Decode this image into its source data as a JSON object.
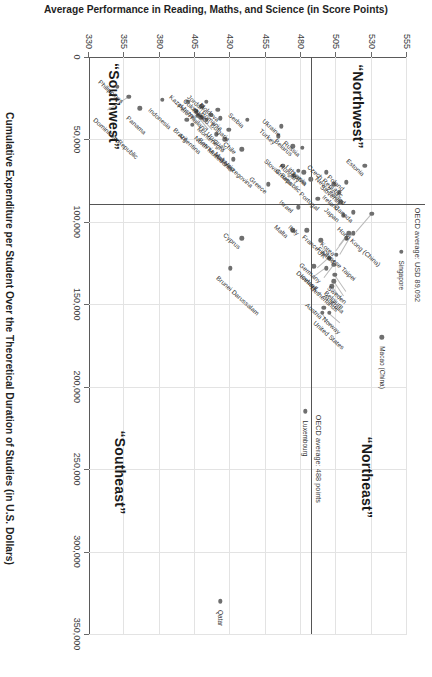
{
  "chart_data": {
    "type": "scatter",
    "title": "",
    "xlabel": "Cumulative Expenditure per Student Over the Theoretical Duration of Studies (in U.S. Dollars)",
    "ylabel": "Average Performance in Reading, Maths, and Science (in Score Points)",
    "xlim": [
      0,
      350000
    ],
    "ylim": [
      330,
      555
    ],
    "xticks": [
      0,
      50000,
      100000,
      150000,
      200000,
      250000,
      300000,
      350000
    ],
    "xticklabels": [
      "0",
      "50,000",
      "100,000",
      "150,000",
      "200,000",
      "250,000",
      "300,000",
      "350,000"
    ],
    "yticks": [
      330,
      355,
      380,
      405,
      430,
      455,
      480,
      505,
      530,
      555
    ],
    "yticklabels": [
      "330",
      "355",
      "380",
      "405",
      "430",
      "455",
      "480",
      "505",
      "530",
      "555"
    ],
    "grid": true,
    "legend": false,
    "reference_lines": [
      {
        "axis": "y",
        "value": 488,
        "label": "OECD average: 488 points"
      },
      {
        "axis": "x",
        "value": 89092,
        "label": "OECD average: USD 89,092"
      }
    ],
    "quadrant_labels": [
      {
        "name": "“Northwest”",
        "x": 30000,
        "y": 520
      },
      {
        "name": "“Northeast”",
        "x": 255000,
        "y": 527
      },
      {
        "name": "“Southwest”",
        "x": 30000,
        "y": 348
      },
      {
        "name": "“Southeast”",
        "x": 252000,
        "y": 352
      }
    ],
    "points": [
      {
        "name": "Singapore",
        "x": 118000,
        "y": 551,
        "lx": 9,
        "ly": -4,
        "rot": 0
      },
      {
        "name": "Macao (China)",
        "x": 170000,
        "y": 537,
        "lx": 9,
        "ly": -4,
        "rot": 0
      },
      {
        "name": "Hong Kong (China)",
        "x": 95000,
        "y": 530,
        "lx": -4,
        "ly": 14,
        "rot": -48,
        "lead": [
          95000,
          530,
          106000,
          519
        ]
      },
      {
        "name": "Estonia",
        "x": 66000,
        "y": 525,
        "lx": -6,
        "ly": 14,
        "rot": -48
      },
      {
        "name": "Chinese Taipei",
        "x": 107000,
        "y": 517,
        "lx": -4,
        "ly": 14,
        "rot": -48,
        "lead": [
          107000,
          517,
          120000,
          508
        ]
      },
      {
        "name": "Canada",
        "x": 94000,
        "y": 517,
        "lx": -6,
        "ly": 14,
        "rot": -48
      },
      {
        "name": "Japan",
        "x": 96000,
        "y": 510,
        "lx": -6,
        "ly": 14,
        "rot": -48
      },
      {
        "name": "Korea",
        "x": 107000,
        "y": 514,
        "lx": -4,
        "ly": 14,
        "rot": -48,
        "lead": [
          107000,
          514,
          115000,
          507
        ]
      },
      {
        "name": "Finland",
        "x": 110000,
        "y": 512,
        "lx": -4,
        "ly": 14,
        "rot": -48,
        "lead": [
          110000,
          512,
          118000,
          505
        ]
      },
      {
        "name": "Poland",
        "x": 76000,
        "y": 512,
        "lx": -6,
        "ly": 14,
        "rot": -48
      },
      {
        "name": "Ireland",
        "x": 88000,
        "y": 508,
        "lx": -6,
        "ly": 14,
        "rot": -48
      },
      {
        "name": "Slovenia",
        "x": 82000,
        "y": 507,
        "lx": -6,
        "ly": 14,
        "rot": -48
      },
      {
        "name": "UK",
        "x": 120000,
        "y": 505,
        "lx": -4,
        "ly": 14,
        "rot": -48
      },
      {
        "name": "Sweden",
        "x": 132000,
        "y": 504,
        "lx": -4,
        "ly": 14,
        "rot": -48,
        "lead": [
          132000,
          504,
          142000,
          512
        ]
      },
      {
        "name": "New Zealand",
        "x": 77000,
        "y": 503,
        "lx": -6,
        "ly": 14,
        "rot": -48
      },
      {
        "name": "Netherlands",
        "x": 126000,
        "y": 503,
        "lx": 9,
        "ly": 9,
        "rot": -48,
        "lead": [
          126000,
          503,
          134000,
          496
        ]
      },
      {
        "name": "Belgium",
        "x": 136000,
        "y": 503,
        "lx": -4,
        "ly": 14,
        "rot": -48,
        "lead": [
          136000,
          503,
          145000,
          510
        ]
      },
      {
        "name": "Germany",
        "x": 122000,
        "y": 500,
        "lx": -4,
        "ly": 14,
        "rot": -48,
        "lead": [
          122000,
          500,
          128000,
          492
        ]
      },
      {
        "name": "Australia",
        "x": 139000,
        "y": 502,
        "lx": -4,
        "ly": 14,
        "rot": -48,
        "lead": [
          139000,
          502,
          147000,
          509
        ]
      },
      {
        "name": "Norway",
        "x": 155000,
        "y": 500,
        "lx": -4,
        "ly": 14,
        "rot": -48,
        "lead": [
          155000,
          500,
          161000,
          508
        ]
      },
      {
        "name": "Czech Republic",
        "x": 70000,
        "y": 498,
        "lx": -6,
        "ly": 14,
        "rot": -48
      },
      {
        "name": "Austria",
        "x": 152000,
        "y": 496,
        "lx": -4,
        "ly": 14,
        "rot": -48
      },
      {
        "name": "Denmark",
        "x": 128000,
        "y": 498,
        "lx": -4,
        "ly": 14,
        "rot": -48,
        "lead": [
          128000,
          498,
          133000,
          490
        ]
      },
      {
        "name": "France",
        "x": 111000,
        "y": 494,
        "lx": -4,
        "ly": 14,
        "rot": -48
      },
      {
        "name": "Portugal",
        "x": 86000,
        "y": 492,
        "lx": -6,
        "ly": 14,
        "rot": -48
      },
      {
        "name": "Iceland",
        "x": 127000,
        "y": 489,
        "lx": 9,
        "ly": 9,
        "rot": -48
      },
      {
        "name": "United States",
        "x": 155000,
        "y": 495,
        "lx": -4,
        "ly": 14,
        "rot": -48,
        "lead": [
          155000,
          495,
          163000,
          502
        ]
      },
      {
        "name": "Latvia",
        "x": 74000,
        "y": 487,
        "lx": -6,
        "ly": 14,
        "rot": -48
      },
      {
        "name": "Lithuania",
        "x": 70000,
        "y": 482,
        "lx": -6,
        "ly": 14,
        "rot": -48
      },
      {
        "name": "Russia",
        "x": 55000,
        "y": 481,
        "lx": -6,
        "ly": 14,
        "rot": -48
      },
      {
        "name": "Hungary",
        "x": 69000,
        "y": 478,
        "lx": -6,
        "ly": 14,
        "rot": -48
      },
      {
        "name": "Italy",
        "x": 105000,
        "y": 484,
        "lx": -4,
        "ly": 14,
        "rot": -48
      },
      {
        "name": "Croatia",
        "x": 72000,
        "y": 475,
        "lx": -6,
        "ly": 14,
        "rot": -48
      },
      {
        "name": "Israel",
        "x": 91000,
        "y": 478,
        "lx": -6,
        "ly": 14,
        "rot": -48
      },
      {
        "name": "Belarus",
        "x": 54000,
        "y": 474,
        "lx": -6,
        "ly": 14,
        "rot": -48
      },
      {
        "name": "Malta",
        "x": 105000,
        "y": 474,
        "lx": -4,
        "ly": 14,
        "rot": -48
      },
      {
        "name": "Slovak Republic",
        "x": 66000,
        "y": 467,
        "lx": -6,
        "ly": 14,
        "rot": -48
      },
      {
        "name": "Ukraine",
        "x": 42000,
        "y": 466,
        "lx": -6,
        "ly": 14,
        "rot": -48
      },
      {
        "name": "Turkey",
        "x": 48000,
        "y": 464,
        "lx": -6,
        "ly": 14,
        "rot": -48
      },
      {
        "name": "Greece",
        "x": 77000,
        "y": 457,
        "lx": -6,
        "ly": 14,
        "rot": -48
      },
      {
        "name": "Serbia",
        "x": 38000,
        "y": 442,
        "lx": -6,
        "ly": 14,
        "rot": -48
      },
      {
        "name": "Cyprus",
        "x": 110000,
        "y": 438,
        "lx": -4,
        "ly": 14,
        "rot": -48
      },
      {
        "name": "Chile",
        "x": 56000,
        "y": 438,
        "lx": -6,
        "ly": 14,
        "rot": -48
      },
      {
        "name": "Bulgaria",
        "x": 44000,
        "y": 429,
        "lx": -6,
        "ly": 14,
        "rot": -48
      },
      {
        "name": "Malaysia",
        "x": 62000,
        "y": 432,
        "lx": -6,
        "ly": 14,
        "rot": -48
      },
      {
        "name": "Uruguay",
        "x": 50000,
        "y": 426,
        "lx": -6,
        "ly": 14,
        "rot": -48
      },
      {
        "name": "Brunei Darussalam",
        "x": 128000,
        "y": 430,
        "lx": 9,
        "ly": 9,
        "rot": -48
      },
      {
        "name": "Romania",
        "x": 37000,
        "y": 423,
        "lx": -6,
        "ly": 14,
        "rot": -48
      },
      {
        "name": "Moldova",
        "x": 32000,
        "y": 421,
        "lx": -6,
        "ly": 14,
        "rot": -48
      },
      {
        "name": "Montenegro",
        "x": 47000,
        "y": 420,
        "lx": -6,
        "ly": 14,
        "rot": -48
      },
      {
        "name": "Mexico",
        "x": 35000,
        "y": 416,
        "lx": -6,
        "ly": 14,
        "rot": -48
      },
      {
        "name": "Jordan",
        "x": 27000,
        "y": 413,
        "lx": -6,
        "ly": 14,
        "rot": -48
      },
      {
        "name": "Thailand",
        "x": 38000,
        "y": 413,
        "lx": -6,
        "ly": 14,
        "rot": -48
      },
      {
        "name": "Colombia",
        "x": 30000,
        "y": 410,
        "lx": -6,
        "ly": 14,
        "rot": -48
      },
      {
        "name": "Bosnia and Herzegovina",
        "x": 36500,
        "y": 409,
        "lx": 9,
        "ly": 9,
        "rot": -48,
        "lead": [
          36500,
          409,
          44000,
          417
        ]
      },
      {
        "name": "North Macedonia",
        "x": 35500,
        "y": 407,
        "lx": 9,
        "ly": 9,
        "rot": -48,
        "lead": [
          35500,
          407,
          43000,
          414
        ]
      },
      {
        "name": "Peru",
        "x": 33000,
        "y": 406,
        "lx": -6,
        "ly": 14,
        "rot": -48
      },
      {
        "name": "Argentina",
        "x": 41000,
        "y": 403,
        "lx": 9,
        "ly": 9,
        "rot": -48
      },
      {
        "name": "Brazil",
        "x": 38000,
        "y": 399,
        "lx": 9,
        "ly": 9,
        "rot": -48
      },
      {
        "name": "Kazakhstan",
        "x": 27000,
        "y": 400,
        "lx": -6,
        "ly": 14,
        "rot": -48
      },
      {
        "name": "Indonesia",
        "x": 26000,
        "y": 382,
        "lx": 9,
        "ly": 9,
        "rot": -48
      },
      {
        "name": "Panama",
        "x": 31000,
        "y": 366,
        "lx": 9,
        "ly": 9,
        "rot": -48
      },
      {
        "name": "Dominican Republic",
        "x": 24000,
        "y": 358,
        "lx": 9,
        "ly": 9,
        "rot": -48,
        "lead": [
          24000,
          358,
          32000,
          343
        ]
      },
      {
        "name": "Philippines",
        "x": 18000,
        "y": 350,
        "lx": -6,
        "ly": 14,
        "rot": -48
      },
      {
        "name": "Luxembourg",
        "x": 215000,
        "y": 483,
        "lx": 9,
        "ly": -4,
        "rot": 0
      },
      {
        "name": "Qatar",
        "x": 330000,
        "y": 423,
        "lx": 9,
        "ly": -4,
        "rot": 0
      }
    ]
  }
}
